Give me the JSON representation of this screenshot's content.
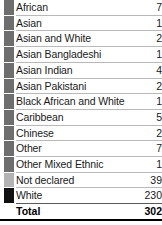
{
  "table": {
    "columns": [
      "Category",
      "Count"
    ],
    "rows": [
      {
        "label": "African",
        "value": "7",
        "swatch_color": "#6e6e6e"
      },
      {
        "label": "Asian",
        "value": "1",
        "swatch_color": "#6e6e6e"
      },
      {
        "label": "Asian and White",
        "value": "2",
        "swatch_color": "#6e6e6e"
      },
      {
        "label": "Asian Bangladeshi",
        "value": "1",
        "swatch_color": "#6e6e6e"
      },
      {
        "label": "Asian Indian",
        "value": "4",
        "swatch_color": "#6e6e6e"
      },
      {
        "label": "Asian Pakistani",
        "value": "2",
        "swatch_color": "#6e6e6e"
      },
      {
        "label": "Black African and White",
        "value": "1",
        "swatch_color": "#6e6e6e"
      },
      {
        "label": "Caribbean",
        "value": "5",
        "swatch_color": "#6e6e6e"
      },
      {
        "label": "Chinese",
        "value": "2",
        "swatch_color": "#6e6e6e"
      },
      {
        "label": "Other",
        "value": "7",
        "swatch_color": "#6e6e6e"
      },
      {
        "label": "Other Mixed Ethnic",
        "value": "1",
        "swatch_color": "#6e6e6e"
      },
      {
        "label": "Not declared",
        "value": "39",
        "swatch_color": "#b3b3b3"
      },
      {
        "label": "White",
        "value": "230",
        "swatch_color": "#111111"
      }
    ],
    "total": {
      "label": "Total",
      "value": "302"
    }
  },
  "style": {
    "separator_color": "#b9b9b9",
    "total_rule_color": "#000000",
    "text_color": "#1a1a1a",
    "background": "#ffffff"
  }
}
